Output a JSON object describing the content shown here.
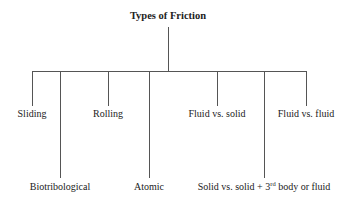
{
  "diagram": {
    "title": "Types of Friction",
    "branches": [
      {
        "label": "Sliding",
        "x": 32,
        "level": "upper"
      },
      {
        "label": "Biotribological",
        "x": 60,
        "level": "lower"
      },
      {
        "label": "Rolling",
        "x": 108,
        "level": "upper"
      },
      {
        "label": "Atomic",
        "x": 149,
        "level": "lower"
      },
      {
        "label": "Fluid vs. solid",
        "x": 217,
        "level": "upper"
      },
      {
        "label_prefix": "Solid vs. solid + 3",
        "label_sup": "rd",
        "label_suffix": " body or fluid",
        "x": 264,
        "level": "lower"
      },
      {
        "label": "Fluid vs. fluid",
        "x": 306,
        "level": "upper"
      }
    ],
    "line_color": "#555555"
  }
}
